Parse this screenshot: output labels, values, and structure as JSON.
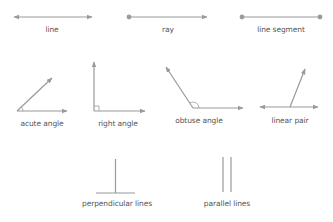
{
  "colors": {
    "stroke": "#9a9a9a",
    "label": "#555555",
    "background": "#ffffff"
  },
  "figures": [
    {
      "id": "line",
      "label": "line"
    },
    {
      "id": "ray",
      "label": "ray"
    },
    {
      "id": "line-segment",
      "label": "line segment"
    },
    {
      "id": "acute-angle",
      "label": "acute angle"
    },
    {
      "id": "right-angle",
      "label": "right angle"
    },
    {
      "id": "obtuse-angle",
      "label": "obtuse angle"
    },
    {
      "id": "linear-pair",
      "label": "linear pair"
    },
    {
      "id": "perpendicular-lines",
      "label": "perpendicular lines"
    },
    {
      "id": "parallel-lines",
      "label": "parallel lines"
    }
  ]
}
